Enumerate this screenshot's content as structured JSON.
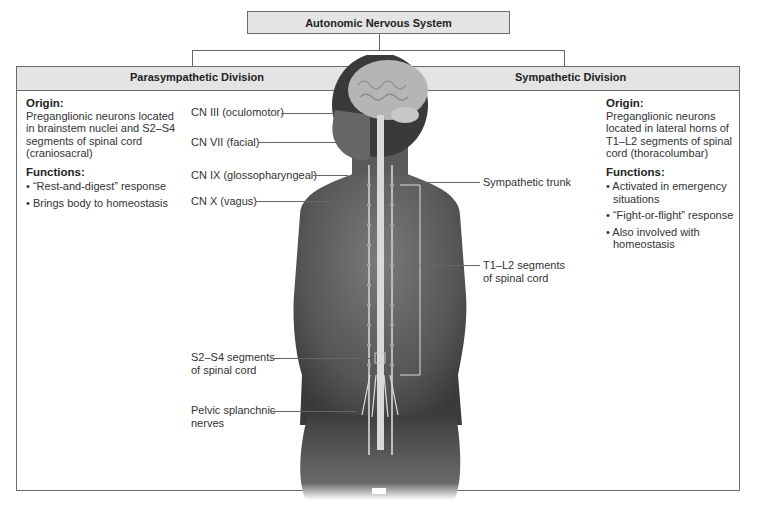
{
  "title": "Autonomic Nervous System",
  "divisions": {
    "parasympathetic": {
      "title": "Parasympathetic Division",
      "origin_heading": "Origin:",
      "origin_text": [
        "Preganglionic neurons located",
        "in brainstem nuclei and S2–S4",
        "segments of spinal cord",
        "(craniosacral)"
      ],
      "functions_heading": "Functions:",
      "functions": [
        "• “Rest-and-digest” response",
        "• Brings body to homeostasis"
      ]
    },
    "sympathetic": {
      "title": "Sympathetic Division",
      "origin_heading": "Origin:",
      "origin_text": [
        "Preganglionic neurons",
        "located in lateral horns of",
        "T1–L2 segments of spinal",
        "cord (thoracolumbar)"
      ],
      "functions_heading": "Functions:",
      "functions": [
        "• Activated in emergency situations",
        "• “Fight-or-flight” response",
        "• Also involved with homeostasis"
      ]
    }
  },
  "labels": {
    "cn3": "CN III (oculomotor)",
    "cn7": "CN VII (facial)",
    "cn9": "CN IX (glossopharyngeal)",
    "cn10": "CN X (vagus)",
    "sympathetic_trunk": "Sympathetic trunk",
    "t1l2_line1": "T1–L2 segments",
    "t1l2_line2": "of spinal cord",
    "s2s4_line1": "S2–S4 segments",
    "s2s4_line2": "of spinal cord",
    "pelvic_line1": "Pelvic splanchnic",
    "pelvic_line2": "nerves"
  },
  "colors": {
    "header_fill": "#e4e4e4",
    "border": "#6a6a6a",
    "text": "#333333"
  }
}
